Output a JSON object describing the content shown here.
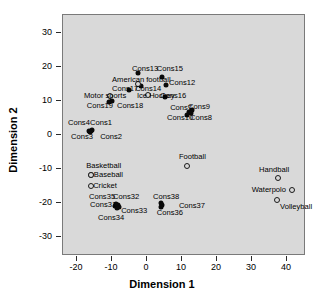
{
  "chart_data": {
    "type": "scatter",
    "title": "",
    "xlabel": "Dimension 1",
    "ylabel": "Dimension 2",
    "xlim": [
      -25,
      47
    ],
    "ylim": [
      -35,
      36
    ],
    "xticks": [
      -20,
      -10,
      0,
      10,
      20,
      30,
      40
    ],
    "yticks": [
      30,
      20,
      10,
      0,
      -10,
      -20,
      -30
    ],
    "xticklabels": [
      "-20",
      "-10",
      "0",
      "10",
      "20",
      "30",
      "40"
    ],
    "yticklabels": [
      "30",
      "20",
      "10",
      "0",
      "-10",
      "-20",
      "-30"
    ],
    "grid": false,
    "legend": false,
    "plot_background": "#d9d9d9",
    "series": [
      {
        "name": "Constructs",
        "marker": "filled",
        "color": "#0a0a0a",
        "points": [
          {
            "label": "Cons13",
            "x": -2.3,
            "y": 17.9,
            "lx": -4.0,
            "ly": 19.2,
            "anchor": "e"
          },
          {
            "label": "Cons15",
            "x": 4.6,
            "y": 16.8,
            "lx": 3.1,
            "ly": 19.2,
            "anchor": "e"
          },
          {
            "label": "Cons12",
            "x": 5.7,
            "y": 14.4,
            "lx": 6.6,
            "ly": 14.9,
            "anchor": "e"
          },
          {
            "label": "Cons14",
            "x": -1.4,
            "y": 14.1,
            "lx": -3.1,
            "ly": 13.2,
            "anchor": "e"
          },
          {
            "label": "Cons17",
            "x": -4.9,
            "y": 12.9,
            "lx": -9.7,
            "ly": 13.2,
            "anchor": "e"
          },
          {
            "label": "Cons16",
            "x": 5.4,
            "y": 10.9,
            "lx": 4.0,
            "ly": 11.2,
            "anchor": "e"
          },
          {
            "label": "Cons18",
            "x": -9.7,
            "y": 9.7,
            "lx": -8.3,
            "ly": 8.2,
            "anchor": "e"
          },
          {
            "label": "Cons19",
            "x": -10.6,
            "y": 9.4,
            "lx": -16.9,
            "ly": 8.2,
            "anchor": "e"
          },
          {
            "label": "Cons9",
            "x": 13.1,
            "y": 7.1,
            "lx": 12.0,
            "ly": 7.9,
            "anchor": "e"
          },
          {
            "label": "Cons7",
            "x": 12.3,
            "y": 6.5,
            "lx": 6.9,
            "ly": 7.6,
            "anchor": "e"
          },
          {
            "label": "Cons8",
            "x": 12.9,
            "y": 6.2,
            "lx": 12.6,
            "ly": 4.7,
            "anchor": "e"
          },
          {
            "label": "Cons10",
            "x": 11.7,
            "y": 5.6,
            "lx": 6.0,
            "ly": 4.7,
            "anchor": "e"
          },
          {
            "label": "Cons1",
            "x": -15.4,
            "y": 1.2,
            "lx": -16.0,
            "ly": 3.2,
            "anchor": "e"
          },
          {
            "label": "Cons2",
            "x": -15.7,
            "y": 0.9,
            "lx": -13.1,
            "ly": -0.9,
            "anchor": "e"
          },
          {
            "label": "Cons4",
            "x": -16.3,
            "y": 0.9,
            "lx": -22.3,
            "ly": 3.2,
            "anchor": "e"
          },
          {
            "label": "Cons3",
            "x": -16.0,
            "y": 0.6,
            "lx": -21.4,
            "ly": -0.9,
            "anchor": "e"
          },
          {
            "label": "Cons32",
            "x": -8.0,
            "y": -20.9,
            "lx": -9.4,
            "ly": -18.5,
            "anchor": "e"
          },
          {
            "label": "Cons31",
            "x": -8.9,
            "y": -21.2,
            "lx": -16.0,
            "ly": -20.9,
            "anchor": "e"
          },
          {
            "label": "Cons33",
            "x": -7.7,
            "y": -21.5,
            "lx": -7.1,
            "ly": -22.6,
            "anchor": "e"
          },
          {
            "label": "Cons35",
            "x": -8.6,
            "y": -20.6,
            "lx": -16.3,
            "ly": -18.5,
            "anchor": "e"
          },
          {
            "label": "Cons34",
            "x": -8.3,
            "y": -21.8,
            "lx": -13.7,
            "ly": -24.7,
            "anchor": "e"
          },
          {
            "label": "Cons38",
            "x": 4.3,
            "y": -20.3,
            "lx": 2.0,
            "ly": -18.5,
            "anchor": "e"
          },
          {
            "label": "Cons36",
            "x": 4.3,
            "y": -21.5,
            "lx": 3.1,
            "ly": -23.2,
            "anchor": "e"
          },
          {
            "label": "Cons37",
            "x": 4.6,
            "y": -20.9,
            "lx": 9.4,
            "ly": -21.2,
            "anchor": "e"
          }
        ]
      },
      {
        "name": "Sports",
        "marker": "open",
        "color": "#1a1a1a",
        "points": [
          {
            "label": "American football",
            "x": -2.3,
            "y": 14.7,
            "lx": -9.7,
            "ly": 15.9,
            "anchor": "e"
          },
          {
            "label": "Ice Hockey",
            "x": 0.6,
            "y": 11.5,
            "lx": -2.6,
            "ly": 11.2,
            "anchor": "e"
          },
          {
            "label": "Motor sports",
            "x": -10.3,
            "y": 11.2,
            "lx": -17.7,
            "ly": 11.2,
            "anchor": "e"
          },
          {
            "label": "Football",
            "x": 11.7,
            "y": -9.4,
            "lx": 9.4,
            "ly": -6.8,
            "anchor": "e"
          },
          {
            "label": "Baseball",
            "x": -15.7,
            "y": -12.1,
            "lx": -14.9,
            "ly": -12.1,
            "anchor": "e"
          },
          {
            "label": "Basketball",
            "x": -15.7,
            "y": -12.1,
            "lx": -17.1,
            "ly": -9.4,
            "anchor": "e"
          },
          {
            "label": "Cricket",
            "x": -15.7,
            "y": -15.3,
            "lx": -15.1,
            "ly": -15.3,
            "anchor": "e"
          },
          {
            "label": "Handball",
            "x": 37.7,
            "y": -12.9,
            "lx": 36.6,
            "ly": -10.6,
            "anchor": "c"
          },
          {
            "label": "Waterpolo",
            "x": 41.7,
            "y": -16.5,
            "lx": 40.0,
            "ly": -16.5,
            "anchor": "w"
          },
          {
            "label": "Volleyball",
            "x": 37.4,
            "y": -19.4,
            "lx": 38.3,
            "ly": -21.5,
            "anchor": "e"
          }
        ]
      }
    ]
  }
}
